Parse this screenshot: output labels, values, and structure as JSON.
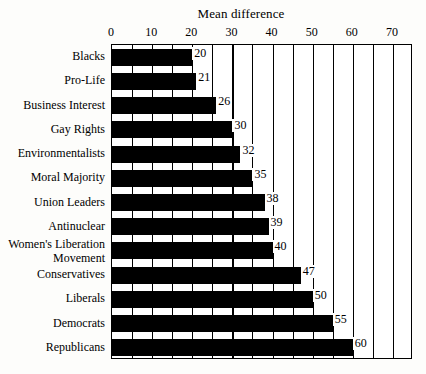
{
  "chart_data": {
    "type": "bar",
    "orientation": "horizontal",
    "title": "Mean difference",
    "xlabel": "",
    "ylabel": "",
    "xlim": [
      0,
      75
    ],
    "xticks": [
      0,
      10,
      20,
      30,
      40,
      50,
      60,
      70
    ],
    "xtick_labels": [
      "0",
      "10",
      "20",
      "30",
      "40",
      "50",
      "60",
      "70"
    ],
    "gridline_interval": 5,
    "grid": true,
    "legend": null,
    "bar_color": "#000000",
    "categories": [
      "Blacks",
      "Pro-Life",
      "Business Interest",
      "Gay Rights",
      "Environmentalists",
      "Moral Majority",
      "Union Leaders",
      "Antinuclear",
      "Women's Liberation Movement",
      "Conservatives",
      "Liberals",
      "Democrats",
      "Republicans"
    ],
    "values": [
      20,
      21,
      26,
      30,
      32,
      35,
      38,
      39,
      40,
      47,
      50,
      55,
      60
    ],
    "data_labels": [
      "20",
      "21",
      "26",
      "30",
      "32",
      "35",
      "38",
      "39",
      "40",
      "47",
      "50",
      "55",
      "60"
    ]
  },
  "categories_display": [
    {
      "line1": "Blacks",
      "line2": ""
    },
    {
      "line1": "Pro-Life",
      "line2": ""
    },
    {
      "line1": "Business Interest",
      "line2": ""
    },
    {
      "line1": "Gay Rights",
      "line2": ""
    },
    {
      "line1": "Environmentalists",
      "line2": ""
    },
    {
      "line1": "Moral Majority",
      "line2": ""
    },
    {
      "line1": "Union Leaders",
      "line2": ""
    },
    {
      "line1": "Antinuclear",
      "line2": ""
    },
    {
      "line1": "Women's Liberation",
      "line2": "Movement"
    },
    {
      "line1": "Conservatives",
      "line2": ""
    },
    {
      "line1": "Liberals",
      "line2": ""
    },
    {
      "line1": "Democrats",
      "line2": ""
    },
    {
      "line1": "Republicans",
      "line2": ""
    }
  ]
}
